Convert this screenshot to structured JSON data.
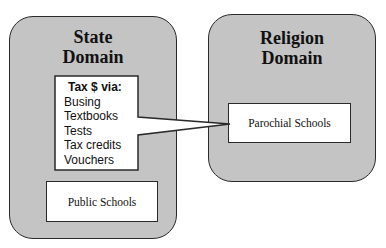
{
  "diagram": {
    "state_domain": {
      "title_line1": "State",
      "title_line2": "Domain",
      "callout": {
        "heading": "Tax $ via:",
        "items": [
          "Busing",
          "Textbooks",
          "Tests",
          "Tax credits",
          "Vouchers"
        ]
      },
      "public_schools_label": "Public Schools"
    },
    "religion_domain": {
      "title_line1": "Religion",
      "title_line2": "Domain",
      "parochial_schools_label": "Parochial Schools"
    },
    "colors": {
      "domain_fill": "#c4c4c4",
      "box_fill": "#ffffff",
      "stroke": "#2a2a2a"
    }
  }
}
